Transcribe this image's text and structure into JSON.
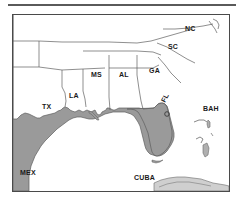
{
  "figure": {
    "name": "southeast-us-gulf-map",
    "type": "reference-map"
  },
  "map": {
    "colors": {
      "land": "#9a9a9a",
      "water": "#ffffff",
      "border": "#4a4a4a",
      "state_line": "#5e5e5e",
      "label": "#1a1a1a",
      "rule": "#5a5a5a",
      "island": "#b0b0b0"
    },
    "frame": {
      "width": 216,
      "height": 176
    },
    "labels": [
      {
        "id": "tx",
        "text": "TX",
        "x": 29,
        "y": 94,
        "kind": "state"
      },
      {
        "id": "la",
        "text": "LA",
        "x": 58,
        "y": 83,
        "kind": "state"
      },
      {
        "id": "ms",
        "text": "MS",
        "x": 80,
        "y": 62,
        "kind": "state"
      },
      {
        "id": "al",
        "text": "AL",
        "x": 108,
        "y": 62,
        "kind": "state"
      },
      {
        "id": "ga",
        "text": "GA",
        "x": 139,
        "y": 58,
        "kind": "state"
      },
      {
        "id": "sc",
        "text": "SC",
        "x": 158,
        "y": 34,
        "kind": "state"
      },
      {
        "id": "nc",
        "text": "NC",
        "x": 175,
        "y": 14,
        "kind": "state"
      },
      {
        "id": "fl",
        "text": "FL",
        "x": 157,
        "y": 93,
        "kind": "state"
      },
      {
        "id": "bah",
        "text": "BAH",
        "x": 194,
        "y": 96,
        "kind": "country"
      },
      {
        "id": "mex",
        "text": "MEX",
        "x": 9,
        "y": 160,
        "kind": "country"
      },
      {
        "id": "cuba",
        "text": "CUBA",
        "x": 126,
        "y": 163,
        "kind": "country"
      }
    ],
    "markers": [
      {
        "id": "city-dot-florida",
        "x": 166,
        "y": 113,
        "r": 2.4
      }
    ]
  }
}
